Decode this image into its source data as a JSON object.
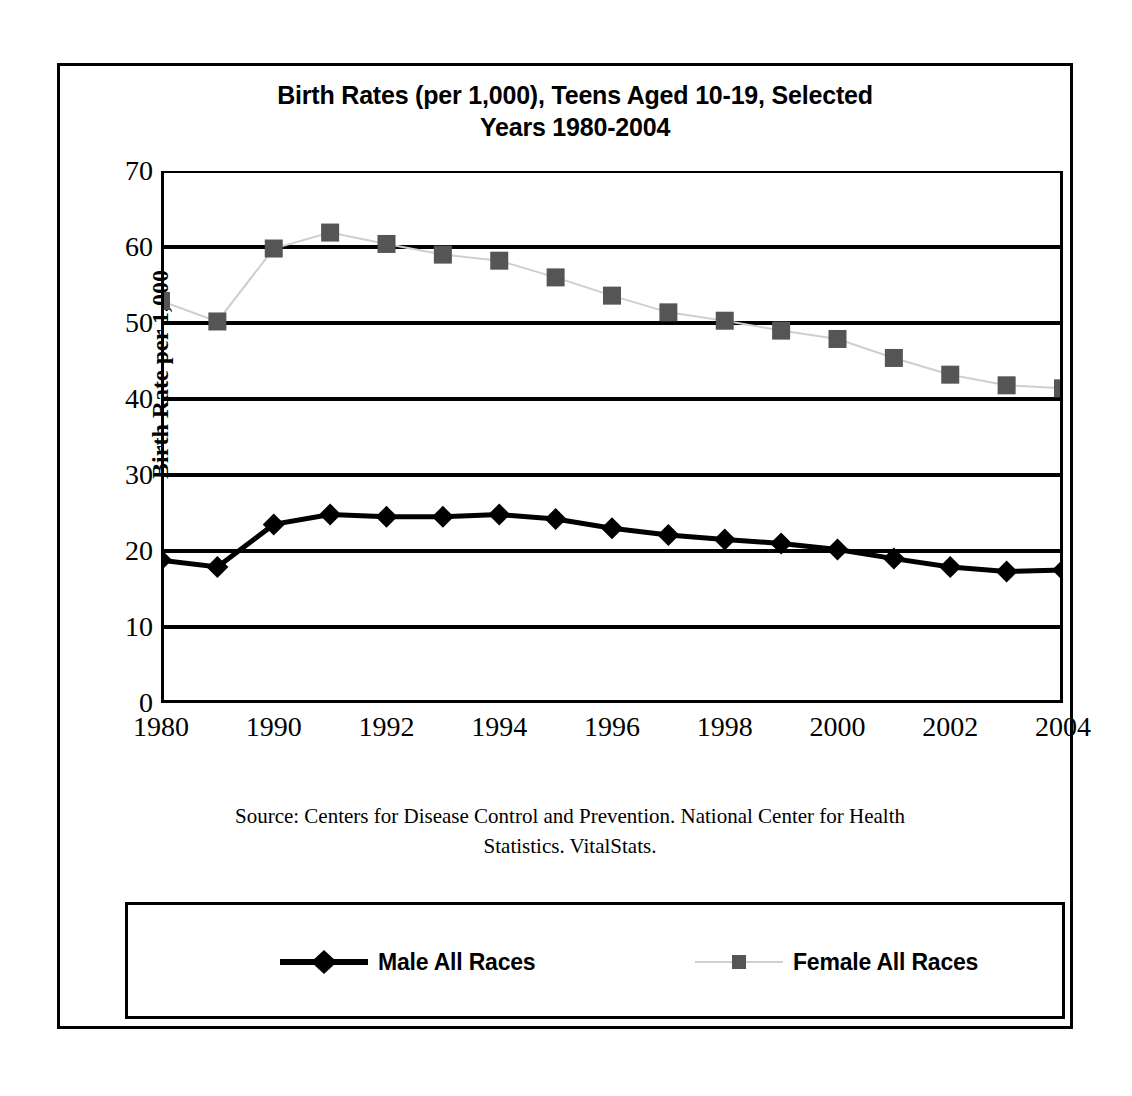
{
  "chart_data": {
    "type": "line",
    "title": "Birth Rates (per 1,000), Teens Aged 10-19, Selected Years 1980-2004",
    "title_line1": "Birth Rates (per 1,000), Teens Aged 10-19, Selected",
    "title_line2": "Years 1980-2004",
    "xlabel": "",
    "ylabel": "Birth Rate per 1,000",
    "ylim": [
      0,
      70
    ],
    "ytick_step": 10,
    "yticks": [
      70,
      60,
      50,
      40,
      30,
      20,
      10,
      0
    ],
    "grid": "horizontal",
    "legend_position": "bottom",
    "x": [
      1980,
      1985,
      1990,
      1991,
      1992,
      1993,
      1994,
      1995,
      1996,
      1997,
      1998,
      1999,
      2000,
      2001,
      2002,
      2003,
      2004
    ],
    "categories": [
      "1980",
      "1985",
      "1990",
      "1991",
      "1992",
      "1993",
      "1994",
      "1995",
      "1996",
      "1997",
      "1998",
      "1999",
      "2000",
      "2001",
      "2002",
      "2003",
      "2004"
    ],
    "xtick_labels": [
      "1980",
      "",
      "1990",
      "",
      "1992",
      "",
      "1994",
      "",
      "1996",
      "",
      "1998",
      "",
      "2000",
      "",
      "2002",
      "",
      "2004"
    ],
    "series": [
      {
        "name": "Male All Races",
        "color": "#000000",
        "marker": "diamond",
        "values": [
          18.8,
          17.9,
          23.5,
          24.8,
          24.5,
          24.5,
          24.8,
          24.2,
          23.0,
          22.1,
          21.5,
          21.0,
          20.2,
          19.0,
          17.9,
          17.3,
          17.5
        ]
      },
      {
        "name": "Female All Races",
        "color": "#555555",
        "marker": "square",
        "values": [
          52.9,
          50.2,
          59.8,
          61.9,
          60.4,
          59.0,
          58.2,
          56.0,
          53.6,
          51.4,
          50.3,
          49.0,
          47.9,
          45.4,
          43.2,
          41.8,
          41.4
        ]
      }
    ],
    "source_note": "Source: Centers for Disease Control and Prevention. National Center for Health Statistics. VitalStats.",
    "source_line1": "Source: Centers for Disease Control and Prevention. National Center for Health",
    "source_line2": "Statistics. VitalStats."
  },
  "legend": {
    "male_label": "Male All Races",
    "female_label": "Female All Races"
  }
}
